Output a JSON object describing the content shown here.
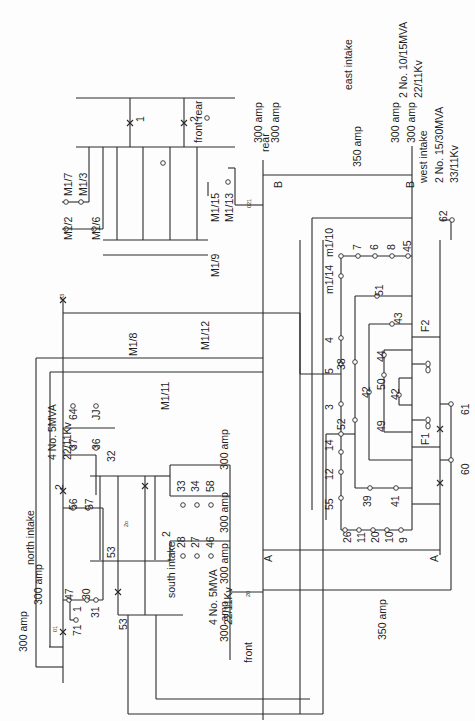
{
  "diagram": {
    "orientation": "rotated -90deg"
  },
  "intakes": {
    "east": {
      "name": "east intake",
      "rating": "2 No. 10/15MVA",
      "voltage": "22/11Kv"
    },
    "north": {
      "name": "north intake",
      "rating": "4 No. 5MVA",
      "voltage": "22/11Kv"
    },
    "south": {
      "name": "south intake",
      "rating": "4 No. 5MVA",
      "voltage": "22/11Kv"
    },
    "west": {
      "name": "west intake",
      "rating": "2 No. 15/30MVA",
      "voltage": "33/11Kv"
    }
  },
  "labels": [
    {
      "id": "east-front-rear",
      "text": "front rear",
      "x": 193,
      "y": 143,
      "size": "s11"
    },
    {
      "id": "east-300a-1",
      "text": "300 amp",
      "x": 253,
      "y": 143,
      "size": "s11"
    },
    {
      "id": "east-300a-2",
      "text": "300 amp",
      "x": 270,
      "y": 143,
      "size": "s11"
    },
    {
      "id": "east-intake",
      "text": "east intake",
      "x": 343,
      "y": 90,
      "size": "s11"
    },
    {
      "id": "east-rating",
      "text": "2 No. 10/15MVA",
      "x": 398,
      "y": 98,
      "size": "s11"
    },
    {
      "id": "east-voltage",
      "text": "22/11Kv",
      "x": 413,
      "y": 98,
      "size": "s11"
    },
    {
      "id": "east-300a-3",
      "text": "300 amp",
      "x": 390,
      "y": 143,
      "size": "s11"
    },
    {
      "id": "east-300a-4",
      "text": "300 amp",
      "x": 406,
      "y": 143,
      "size": "s11"
    },
    {
      "id": "m1-7",
      "text": "M1/7",
      "x": 63,
      "y": 196,
      "size": "s11"
    },
    {
      "id": "m1-3",
      "text": "M1/3",
      "x": 78,
      "y": 196,
      "size": "s11"
    },
    {
      "id": "m1-2",
      "text": "M1/2",
      "x": 63,
      "y": 240,
      "size": "s11"
    },
    {
      "id": "m1-6",
      "text": "M1/6",
      "x": 91,
      "y": 240,
      "size": "s11"
    },
    {
      "id": "m1-15",
      "text": "M1/15",
      "x": 210,
      "y": 222,
      "size": "s11"
    },
    {
      "id": "m1-13",
      "text": "M1/13",
      "x": 224,
      "y": 222,
      "size": "s11"
    },
    {
      "id": "m1-9",
      "text": "M1/9",
      "x": 210,
      "y": 277,
      "size": "s11"
    },
    {
      "id": "rear",
      "text": "rear",
      "x": 260,
      "y": 152,
      "size": "s11"
    },
    {
      "id": "b-left",
      "text": "B",
      "x": 273,
      "y": 188,
      "size": "s11"
    },
    {
      "id": "b-right",
      "text": "B",
      "x": 405,
      "y": 188,
      "size": "s11"
    },
    {
      "id": "amp350-top",
      "text": "350 amp",
      "x": 352,
      "y": 167,
      "size": "s11"
    },
    {
      "id": "west-intake",
      "text": "west intake",
      "x": 418,
      "y": 183,
      "size": "s11"
    },
    {
      "id": "west-rating",
      "text": "2 No. 15/30MVA",
      "x": 434,
      "y": 183,
      "size": "s11"
    },
    {
      "id": "west-voltage",
      "text": "33/11Kv",
      "x": 449,
      "y": 183,
      "size": "s11"
    },
    {
      "id": "n62",
      "text": "62",
      "x": 438,
      "y": 222,
      "size": "s11"
    },
    {
      "id": "m1-8",
      "text": "M1/8",
      "x": 128,
      "y": 356,
      "size": "s11"
    },
    {
      "id": "m1-12",
      "text": "M1/12",
      "x": 200,
      "y": 350,
      "size": "s11"
    },
    {
      "id": "m1-11",
      "text": "M1/11",
      "x": 160,
      "y": 410,
      "size": "s11"
    },
    {
      "id": "north-rating",
      "text": "4 No. 5MVA",
      "x": 47,
      "y": 460,
      "size": "s11"
    },
    {
      "id": "north-voltage",
      "text": "22/11Kv",
      "x": 62,
      "y": 460,
      "size": "s11"
    },
    {
      "id": "north-intake",
      "text": "north intake",
      "x": 25,
      "y": 565,
      "size": "s11"
    },
    {
      "id": "n64",
      "text": "64",
      "x": 68,
      "y": 420,
      "size": "s11"
    },
    {
      "id": "njj",
      "text": "JJ",
      "x": 91,
      "y": 420,
      "size": "s11"
    },
    {
      "id": "n37",
      "text": "37",
      "x": 68,
      "y": 450,
      "size": "s11"
    },
    {
      "id": "n36",
      "text": "36",
      "x": 91,
      "y": 450,
      "size": "s11"
    },
    {
      "id": "n32",
      "text": "32",
      "x": 106,
      "y": 462,
      "size": "s11"
    },
    {
      "id": "amp300-s1",
      "text": "300 amp",
      "x": 219,
      "y": 470,
      "size": "s11"
    },
    {
      "id": "amp300-s2",
      "text": "300 amp",
      "x": 219,
      "y": 533,
      "size": "s11"
    },
    {
      "id": "amp300-s3",
      "text": "300 amp",
      "x": 219,
      "y": 584,
      "size": "s11"
    },
    {
      "id": "amp300-s4",
      "text": "300 amp",
      "x": 219,
      "y": 642,
      "size": "s11"
    },
    {
      "id": "n33",
      "text": "33",
      "x": 176,
      "y": 492,
      "size": "s11"
    },
    {
      "id": "n34",
      "text": "34",
      "x": 190,
      "y": 492,
      "size": "s11"
    },
    {
      "id": "n58",
      "text": "58",
      "x": 205,
      "y": 492,
      "size": "s11"
    },
    {
      "id": "n28",
      "text": "28",
      "x": 176,
      "y": 548,
      "size": "s11"
    },
    {
      "id": "n27",
      "text": "27",
      "x": 190,
      "y": 548,
      "size": "s11"
    },
    {
      "id": "n46",
      "text": "46",
      "x": 205,
      "y": 548,
      "size": "s11"
    },
    {
      "id": "south-intake",
      "text": "south intake",
      "x": 166,
      "y": 598,
      "size": "s11"
    },
    {
      "id": "n2-top",
      "text": "2",
      "x": 54,
      "y": 490,
      "size": "s11"
    },
    {
      "id": "n56",
      "text": "56",
      "x": 68,
      "y": 510,
      "size": "s11"
    },
    {
      "id": "n57",
      "text": "57",
      "x": 84,
      "y": 510,
      "size": "s11"
    },
    {
      "id": "n53-a",
      "text": "53",
      "x": 106,
      "y": 558,
      "size": "s11"
    },
    {
      "id": "n53-b",
      "text": "53",
      "x": 118,
      "y": 630,
      "size": "s11"
    },
    {
      "id": "n47",
      "text": "47",
      "x": 64,
      "y": 600,
      "size": "s11"
    },
    {
      "id": "n1",
      "text": "1",
      "x": 72,
      "y": 612,
      "size": "s11"
    },
    {
      "id": "n30",
      "text": "30",
      "x": 81,
      "y": 600,
      "size": "s11"
    },
    {
      "id": "n31",
      "text": "31",
      "x": 90,
      "y": 618,
      "size": "s11"
    },
    {
      "id": "n71",
      "text": "71",
      "x": 72,
      "y": 636,
      "size": "s11"
    },
    {
      "id": "amp300-n1",
      "text": "300 amp",
      "x": 33,
      "y": 605,
      "size": "s11"
    },
    {
      "id": "amp300-n2",
      "text": "300 amp",
      "x": 18,
      "y": 652,
      "size": "s11"
    },
    {
      "id": "south-rating",
      "text": "4 No. 5MVA",
      "x": 208,
      "y": 625,
      "size": "s11"
    },
    {
      "id": "south-voltage",
      "text": "22/11Kv",
      "x": 223,
      "y": 625,
      "size": "s11"
    },
    {
      "id": "n2-south",
      "text": "2",
      "x": 161,
      "y": 537,
      "size": "s11"
    },
    {
      "id": "front",
      "text": "front",
      "x": 243,
      "y": 663,
      "size": "s11"
    },
    {
      "id": "a-left",
      "text": "A",
      "x": 263,
      "y": 562,
      "size": "s11"
    },
    {
      "id": "a-right",
      "text": "A",
      "x": 429,
      "y": 562,
      "size": "s11"
    },
    {
      "id": "amp350-bottom",
      "text": "350 amp",
      "x": 377,
      "y": 640,
      "size": "s11"
    },
    {
      "id": "m1-14",
      "text": "m1/14",
      "x": 324,
      "y": 294,
      "size": "s11"
    },
    {
      "id": "m1-10",
      "text": "m1/10",
      "x": 324,
      "y": 257,
      "size": "s11"
    },
    {
      "id": "n7",
      "text": "7",
      "x": 352,
      "y": 250,
      "size": "s11"
    },
    {
      "id": "n6",
      "text": "6",
      "x": 369,
      "y": 250,
      "size": "s11"
    },
    {
      "id": "n8",
      "text": "8",
      "x": 386,
      "y": 250,
      "size": "s11"
    },
    {
      "id": "n45",
      "text": "45",
      "x": 402,
      "y": 252,
      "size": "s11"
    },
    {
      "id": "n51",
      "text": "51",
      "x": 374,
      "y": 296,
      "size": "s11"
    },
    {
      "id": "n43",
      "text": "43",
      "x": 393,
      "y": 324,
      "size": "s11"
    },
    {
      "id": "nf2",
      "text": "F2",
      "x": 420,
      "y": 332,
      "size": "s11"
    },
    {
      "id": "n4",
      "text": "4",
      "x": 324,
      "y": 343,
      "size": "s11"
    },
    {
      "id": "n5",
      "text": "5",
      "x": 324,
      "y": 374,
      "size": "s11"
    },
    {
      "id": "n38",
      "text": "38",
      "x": 336,
      "y": 370,
      "size": "s11"
    },
    {
      "id": "n44",
      "text": "44",
      "x": 376,
      "y": 362,
      "size": "s11"
    },
    {
      "id": "n50",
      "text": "50",
      "x": 376,
      "y": 390,
      "size": "s11"
    },
    {
      "id": "n42-a",
      "text": "42",
      "x": 361,
      "y": 398,
      "size": "s11"
    },
    {
      "id": "n42-b",
      "text": "42",
      "x": 390,
      "y": 400,
      "size": "s11"
    },
    {
      "id": "n3",
      "text": "3",
      "x": 324,
      "y": 410,
      "size": "s11"
    },
    {
      "id": "n52",
      "text": "52",
      "x": 336,
      "y": 430,
      "size": "s11"
    },
    {
      "id": "n49",
      "text": "49",
      "x": 376,
      "y": 432,
      "size": "s11"
    },
    {
      "id": "nf1",
      "text": "F1",
      "x": 420,
      "y": 445,
      "size": "s11"
    },
    {
      "id": "n61",
      "text": "61",
      "x": 460,
      "y": 415,
      "size": "s11"
    },
    {
      "id": "n14",
      "text": "14",
      "x": 324,
      "y": 451,
      "size": "s11"
    },
    {
      "id": "n12",
      "text": "12",
      "x": 324,
      "y": 480,
      "size": "s11"
    },
    {
      "id": "n60",
      "text": "60",
      "x": 460,
      "y": 475,
      "size": "s11"
    },
    {
      "id": "n55",
      "text": "55",
      "x": 324,
      "y": 510,
      "size": "s11"
    },
    {
      "id": "n39",
      "text": "39",
      "x": 362,
      "y": 507,
      "size": "s11"
    },
    {
      "id": "n41",
      "text": "41",
      "x": 390,
      "y": 507,
      "size": "s11"
    },
    {
      "id": "n26",
      "text": "26",
      "x": 342,
      "y": 543,
      "size": "s11"
    },
    {
      "id": "n11",
      "text": "11",
      "x": 356,
      "y": 543,
      "size": "s11"
    },
    {
      "id": "n20",
      "text": "20",
      "x": 370,
      "y": 543,
      "size": "s11"
    },
    {
      "id": "n10",
      "text": "10",
      "x": 384,
      "y": 543,
      "size": "s11"
    },
    {
      "id": "n9",
      "text": "9",
      "x": 398,
      "y": 543,
      "size": "s11"
    },
    {
      "id": "sw-1",
      "text": "1",
      "x": 135,
      "y": 122,
      "size": "s11"
    },
    {
      "id": "sw-2",
      "text": "2",
      "x": 189,
      "y": 122,
      "size": "s11"
    },
    {
      "id": "sw-3",
      "text": "03",
      "x": 60,
      "y": 300,
      "size": "s6"
    },
    {
      "id": "sw-d1",
      "text": "01",
      "x": 53,
      "y": 632,
      "size": "s6"
    },
    {
      "id": "sw-21",
      "text": "021",
      "x": 247,
      "y": 208,
      "size": "s6"
    },
    {
      "id": "sw-2o",
      "text": "2o",
      "x": 124,
      "y": 527,
      "size": "s6"
    },
    {
      "id": "sw-20",
      "text": "20",
      "x": 246,
      "y": 597,
      "size": "s6"
    }
  ],
  "nodes": [
    [
      66,
      202
    ],
    [
      81,
      202
    ],
    [
      66,
      229
    ],
    [
      94,
      229
    ],
    [
      228,
      182
    ],
    [
      73,
      406
    ],
    [
      96,
      406
    ],
    [
      73,
      448
    ],
    [
      96,
      448
    ],
    [
      207,
      118
    ],
    [
      163,
      163
    ],
    [
      183,
      505
    ],
    [
      197,
      505
    ],
    [
      211,
      505
    ],
    [
      183,
      556
    ],
    [
      197,
      556
    ],
    [
      211,
      556
    ],
    [
      73,
      508
    ],
    [
      88,
      508
    ],
    [
      69,
      600
    ],
    [
      87,
      600
    ],
    [
      96,
      600
    ],
    [
      76,
      620
    ],
    [
      341,
      256
    ],
    [
      358,
      256
    ],
    [
      375,
      256
    ],
    [
      392,
      256
    ],
    [
      408,
      256
    ],
    [
      341,
      276
    ],
    [
      377,
      296
    ],
    [
      392,
      324
    ],
    [
      341,
      338
    ],
    [
      341,
      364
    ],
    [
      355,
      362
    ],
    [
      384,
      355
    ],
    [
      384,
      375
    ],
    [
      399,
      395
    ],
    [
      341,
      404
    ],
    [
      341,
      434
    ],
    [
      355,
      420
    ],
    [
      369,
      392
    ],
    [
      341,
      452
    ],
    [
      341,
      472
    ],
    [
      341,
      498
    ],
    [
      345,
      530
    ],
    [
      359,
      530
    ],
    [
      373,
      530
    ],
    [
      387,
      530
    ],
    [
      401,
      530
    ],
    [
      370,
      488
    ],
    [
      396,
      488
    ],
    [
      451,
      404
    ],
    [
      451,
      460
    ],
    [
      452,
      220
    ]
  ]
}
